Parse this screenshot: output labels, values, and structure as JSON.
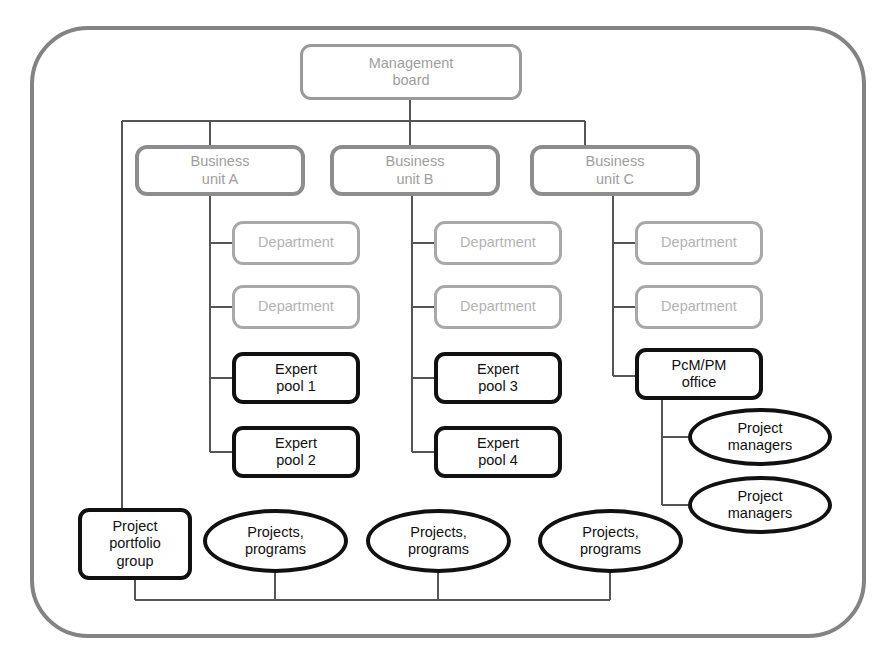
{
  "diagram": {
    "background_color": "#ffffff",
    "frame": {
      "label": "organization-boundary",
      "color": "#838383"
    },
    "palette": {
      "grey_border": "#8d8d8d",
      "grey_text": "#9e9e9e",
      "light_grey_border": "#a8a8a8",
      "light_grey_text": "#b3b3b3",
      "black": "#111111",
      "connector": "#555555"
    },
    "nodes": {
      "management_board": "Management\nboard",
      "business_unit_a": "Business\nunit A",
      "business_unit_b": "Business\nunit B",
      "business_unit_c": "Business\nunit C",
      "department_a1": "Department",
      "department_a2": "Department",
      "department_b1": "Department",
      "department_b2": "Department",
      "department_c1": "Department",
      "department_c2": "Department",
      "expert_pool_1": "Expert\npool 1",
      "expert_pool_2": "Expert\npool 2",
      "expert_pool_3": "Expert\npool 3",
      "expert_pool_4": "Expert\npool 4",
      "pcm_pm_office": "PcM/PM\noffice",
      "project_managers_1": "Project\nmanagers",
      "project_managers_2": "Project\nmanagers",
      "project_portfolio_group": "Project\nportfolio\ngroup",
      "projects_programs_1": "Projects,\nprograms",
      "projects_programs_2": "Projects,\nprograms",
      "projects_programs_3": "Projects,\nprograms"
    }
  }
}
